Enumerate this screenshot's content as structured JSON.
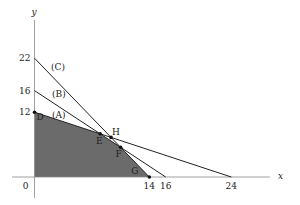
{
  "chart_data": {
    "type": "line",
    "title": "",
    "xlabel": "x",
    "ylabel": "y",
    "origin_label": "0",
    "x_ticks": [
      14,
      16,
      24
    ],
    "y_ticks": [
      12,
      16,
      22
    ],
    "lines": [
      {
        "name": "(A)",
        "from": [
          0,
          12
        ],
        "to": [
          24,
          0
        ]
      },
      {
        "name": "(B)",
        "from": [
          0,
          16
        ],
        "to": [
          16,
          0
        ]
      },
      {
        "name": "(C)",
        "from": [
          0,
          22
        ],
        "to": [
          14,
          0
        ]
      }
    ],
    "points": [
      {
        "name": "D",
        "x": 0,
        "y": 12
      },
      {
        "name": "E",
        "x": 8,
        "y": 8
      },
      {
        "name": "H",
        "x": 9.33,
        "y": 7.33
      },
      {
        "name": "F",
        "x": 10.5,
        "y": 5.5
      },
      {
        "name": "G",
        "x": 14,
        "y": 0
      }
    ],
    "feasible_region": [
      [
        0,
        0
      ],
      [
        0,
        12
      ],
      [
        8,
        8
      ],
      [
        10.5,
        5.5
      ],
      [
        14,
        0
      ]
    ],
    "region_color": "#6b6b6b",
    "grid": false
  }
}
